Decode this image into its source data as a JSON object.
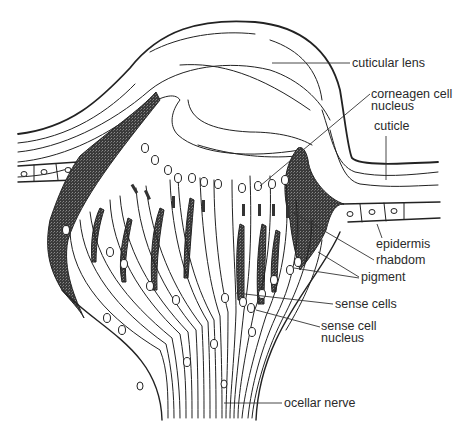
{
  "diagram": {
    "type": "anatomical cross-section",
    "colors": {
      "ink": "#222222",
      "pigment": "#3a3a3a",
      "background": "#ffffff"
    },
    "labels": [
      {
        "id": "cuticular-lens",
        "lines": [
          "cuticular lens"
        ],
        "x": 352,
        "y": 67,
        "leader": [
          [
            352,
            63
          ],
          [
            290,
            63
          ]
        ]
      },
      {
        "id": "corneagen-cell-nucleus",
        "lines": [
          "corneagen cell",
          "nucleus"
        ],
        "x": 371,
        "y": 100,
        "leader": [
          [
            370,
            94
          ],
          [
            262,
            185
          ]
        ]
      },
      {
        "id": "cuticle",
        "lines": [
          "cuticle"
        ],
        "x": 374,
        "y": 129,
        "leader": [
          [
            386,
            134
          ],
          [
            386,
            180
          ]
        ]
      },
      {
        "id": "epidermis",
        "lines": [
          "epidermis"
        ],
        "x": 376,
        "y": 247,
        "leader": [
          [
            378,
            237
          ],
          [
            373,
            227
          ]
        ]
      },
      {
        "id": "rhabdom",
        "lines": [
          "rhabdom"
        ],
        "x": 376,
        "y": 264,
        "leader": [
          [
            375,
            260
          ],
          [
            300,
            215
          ]
        ]
      },
      {
        "id": "pigment",
        "lines": [
          "pigment"
        ],
        "x": 361,
        "y": 280,
        "leader": [
          [
            360,
            276
          ],
          [
            320,
            252
          ]
        ],
        "leader2": [
          [
            360,
            277
          ],
          [
            280,
            268
          ]
        ]
      },
      {
        "id": "sense-cells",
        "lines": [
          "sense cells"
        ],
        "x": 334,
        "y": 307,
        "leader": [
          [
            333,
            303
          ],
          [
            236,
            293
          ]
        ]
      },
      {
        "id": "sense-cell-nucleus",
        "lines": [
          "sense cell",
          "nucleus"
        ],
        "x": 321,
        "y": 330,
        "leader": [
          [
            321,
            325
          ],
          [
            259,
            310
          ]
        ]
      },
      {
        "id": "ocellar-nerve",
        "lines": [
          "ocellar nerve"
        ],
        "x": 283,
        "y": 407,
        "leader": [
          [
            282,
            403
          ],
          [
            222,
            403
          ]
        ]
      }
    ]
  }
}
